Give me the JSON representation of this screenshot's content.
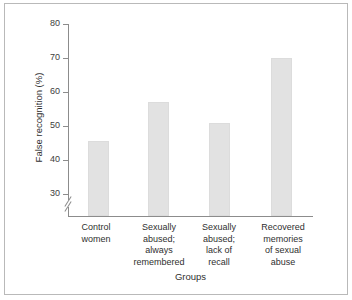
{
  "figure": {
    "background_color": "#ffffff",
    "border_color": "#b9b9b9",
    "axis_color": "#8c8c8c",
    "bar_color": "#e2e2e2",
    "text_color": "#2f2f2f"
  },
  "chart_data": {
    "type": "bar",
    "title": "",
    "subtitle": "",
    "xlabel": "Groups",
    "ylabel": "False recognition (%)",
    "categories": [
      "Control women",
      "Sexually abused; always remembered",
      "Sexually abused; lack of recall",
      "Recovered memories of sexual abuse"
    ],
    "category_lines": [
      [
        "Control",
        "women"
      ],
      [
        "Sexually",
        "abused;",
        "always",
        "remembered"
      ],
      [
        "Sexually",
        "abused;",
        "lack of",
        "recall"
      ],
      [
        "Recovered",
        "memories",
        "of sexual",
        "abuse"
      ]
    ],
    "values": [
      45.5,
      57,
      51,
      70
    ],
    "ylim": [
      25,
      80
    ],
    "yticks": [
      30,
      40,
      50,
      60,
      70,
      80
    ],
    "ytick_labels": [
      "30",
      "40",
      "50",
      "60",
      "70",
      "80"
    ],
    "axis_break": true,
    "axis_break_position": "below 30",
    "grid": false,
    "legend": false,
    "legend_position": "none",
    "bar_color": "#e2e2e2"
  },
  "axis": {
    "y_title": "False recognition (%)",
    "x_title": "Groups",
    "tick_80": "80",
    "tick_70": "70",
    "tick_60": "60",
    "tick_50": "50",
    "tick_40": "40",
    "tick_30": "30"
  },
  "categories": {
    "c0_l0": "Control",
    "c0_l1": "women",
    "c1_l0": "Sexually",
    "c1_l1": "abused;",
    "c1_l2": "always",
    "c1_l3": "remembered",
    "c2_l0": "Sexually",
    "c2_l1": "abused;",
    "c2_l2": "lack of",
    "c2_l3": "recall",
    "c3_l0": "Recovered",
    "c3_l1": "memories",
    "c3_l2": "of sexual",
    "c3_l3": "abuse"
  }
}
